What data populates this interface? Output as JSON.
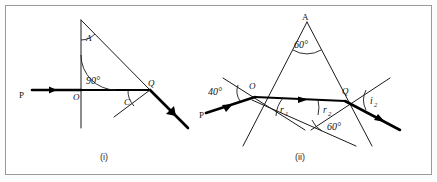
{
  "figure": {
    "background_color": "#ffffff",
    "frame_color": "#9a9a9a",
    "ink_color": "#000000"
  },
  "diagram_i": {
    "caption": "(i)",
    "apex_label": "A",
    "incident_ray_label": "P",
    "first_point_label": "O",
    "second_point_label": "Q",
    "normal_angle_label": "90°",
    "critical_angle_label": "C"
  },
  "diagram_ii": {
    "caption": "(ii)",
    "apex_label": "A",
    "apex_angle_label": "60°",
    "incident_ray_label": "P",
    "first_point_label": "O",
    "second_point_label": "Q",
    "incidence_angle_label": "40°",
    "refraction_angle_1_label": "r",
    "refraction_angle_1_sub": "1",
    "refraction_angle_2_label": "r",
    "refraction_angle_2_sub": "2",
    "emergent_angle_label": "i",
    "emergent_angle_sub": "2",
    "base_angle_label": "60°"
  }
}
